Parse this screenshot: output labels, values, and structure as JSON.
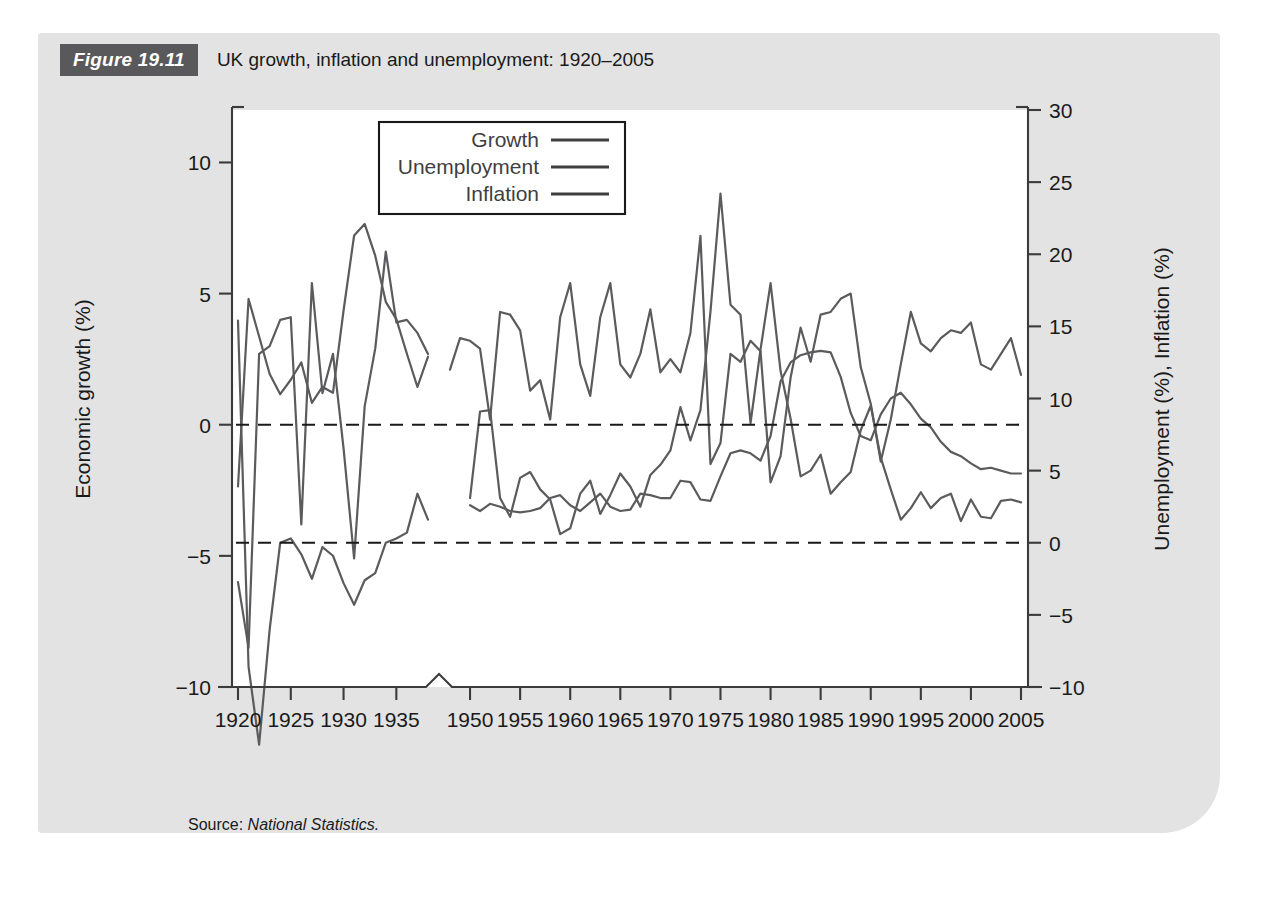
{
  "figure": {
    "tag": "Figure 19.11",
    "title": "UK growth, inflation and unemployment: 1920–2005",
    "source_label": "Source:",
    "source_value": "National Statistics."
  },
  "chart_data": {
    "type": "line",
    "title": "UK growth, inflation and unemployment: 1920–2005",
    "xlabel": "",
    "ylabel": "Economic growth (%)",
    "y2label": "Unemployment (%), Inflation (%)",
    "xlim": [
      1920,
      2005
    ],
    "ylim": [
      -10,
      12
    ],
    "y2lim": [
      -10,
      30
    ],
    "yticks": [
      -10,
      -5,
      0,
      5,
      10
    ],
    "yticklabels": [
      "−10",
      "−5",
      "0",
      "5",
      "10"
    ],
    "y2ticks": [
      -10,
      -5,
      0,
      5,
      10,
      15,
      20,
      25,
      30
    ],
    "y2ticklabels": [
      "−10",
      "−5",
      "0",
      "5",
      "10",
      "15",
      "20",
      "25",
      "30"
    ],
    "xticks": [
      1920,
      1925,
      1930,
      1935,
      1950,
      1955,
      1960,
      1965,
      1970,
      1975,
      1980,
      1985,
      1990,
      1995,
      2000,
      2005
    ],
    "xticklabels": [
      "1920",
      "1925",
      "1930",
      "1935",
      "1950",
      "1955",
      "1960",
      "1965",
      "1970",
      "1975",
      "1980",
      "1985",
      "1990",
      "1995",
      "2000",
      "2005"
    ],
    "axis_break": {
      "after": 1935,
      "before": 1950,
      "note": "zigzag break on x-axis between 1938 and 1948"
    },
    "grid": false,
    "reference_lines": [
      {
        "axis": "left",
        "value": 0,
        "style": "dashed"
      },
      {
        "axis": "right",
        "value": 0,
        "style": "dashed"
      }
    ],
    "legend": {
      "position": "top-center-inside",
      "entries": [
        "Growth",
        "Unemployment",
        "Inflation"
      ]
    },
    "series": [
      {
        "name": "Growth",
        "axis": "left",
        "unit": "%",
        "x": [
          1920,
          1921,
          1922,
          1923,
          1924,
          1925,
          1926,
          1927,
          1928,
          1929,
          1930,
          1931,
          1932,
          1933,
          1934,
          1935,
          1936,
          1937,
          1938
        ],
        "values": [
          -6.0,
          -8.5,
          2.7,
          3.0,
          4.0,
          4.1,
          -3.8,
          5.4,
          1.2,
          2.7,
          -0.9,
          -5.1,
          0.7,
          2.9,
          6.6,
          3.9,
          4.0,
          3.5,
          2.7
        ]
      },
      {
        "name": "Growth",
        "axis": "left",
        "unit": "%",
        "x": [
          1948,
          1949,
          1950,
          1951,
          1952,
          1953,
          1954,
          1955,
          1956,
          1957,
          1958,
          1959,
          1960,
          1961,
          1962,
          1963,
          1964,
          1965,
          1966,
          1967,
          1968,
          1969,
          1970,
          1971,
          1972,
          1973,
          1974,
          1975,
          1976,
          1977,
          1978,
          1979,
          1980,
          1981,
          1982,
          1983,
          1984,
          1985,
          1986,
          1987,
          1988,
          1989,
          1990,
          1991,
          1992,
          1993,
          1994,
          1995,
          1996,
          1997,
          1998,
          1999,
          2000,
          2001,
          2002,
          2003,
          2004,
          2005
        ],
        "values": [
          2.1,
          3.3,
          3.2,
          2.9,
          0.2,
          4.3,
          4.2,
          3.6,
          1.3,
          1.7,
          0.2,
          4.1,
          5.4,
          2.3,
          1.1,
          4.1,
          5.4,
          2.3,
          1.8,
          2.7,
          4.4,
          2.0,
          2.5,
          2.0,
          3.5,
          7.2,
          -1.5,
          -0.7,
          2.7,
          2.4,
          3.2,
          2.8,
          -2.2,
          -1.2,
          1.8,
          3.7,
          2.4,
          4.2,
          4.3,
          4.8,
          5.0,
          2.2,
          0.8,
          -1.4,
          0.2,
          2.3,
          4.3,
          3.1,
          2.8,
          3.3,
          3.6,
          3.5,
          3.9,
          2.3,
          2.1,
          2.7,
          3.3,
          1.9
        ]
      },
      {
        "name": "Unemployment",
        "axis": "right",
        "unit": "%",
        "x": [
          1920,
          1921,
          1922,
          1923,
          1924,
          1925,
          1926,
          1927,
          1928,
          1929,
          1930,
          1931,
          1932,
          1933,
          1934,
          1935,
          1936,
          1937,
          1938
        ],
        "values": [
          3.9,
          16.9,
          14.3,
          11.7,
          10.3,
          11.3,
          12.5,
          9.7,
          10.8,
          10.4,
          16.1,
          21.3,
          22.1,
          19.9,
          16.7,
          15.5,
          13.1,
          10.8,
          12.9
        ]
      },
      {
        "name": "Unemployment",
        "axis": "right",
        "unit": "%",
        "x": [
          1950,
          1951,
          1952,
          1953,
          1954,
          1955,
          1956,
          1957,
          1958,
          1959,
          1960,
          1961,
          1962,
          1963,
          1964,
          1965,
          1966,
          1967,
          1968,
          1969,
          1970,
          1971,
          1972,
          1973,
          1974,
          1975,
          1976,
          1977,
          1978,
          1979,
          1980,
          1981,
          1982,
          1983,
          1984,
          1985,
          1986,
          1987,
          1988,
          1989,
          1990,
          1991,
          1992,
          1993,
          1994,
          1995,
          1996,
          1997,
          1998,
          1999,
          2000,
          2001,
          2002,
          2003,
          2004,
          2005
        ],
        "values": [
          2.6,
          2.2,
          2.7,
          2.5,
          2.2,
          2.1,
          2.2,
          2.4,
          3.1,
          3.3,
          2.6,
          2.2,
          2.8,
          3.4,
          2.5,
          2.2,
          2.3,
          3.4,
          3.3,
          3.1,
          3.1,
          4.3,
          4.2,
          3.0,
          2.9,
          4.6,
          6.2,
          6.4,
          6.2,
          5.7,
          7.4,
          11.2,
          12.5,
          13.0,
          13.2,
          13.3,
          13.2,
          11.5,
          9.0,
          7.4,
          7.1,
          8.9,
          10.0,
          10.4,
          9.6,
          8.6,
          8.0,
          7.0,
          6.3,
          6.0,
          5.5,
          5.1,
          5.2,
          5.0,
          4.8,
          4.8
        ]
      },
      {
        "name": "Inflation",
        "axis": "right",
        "unit": "%",
        "x": [
          1920,
          1921,
          1922,
          1923,
          1924,
          1925,
          1926,
          1927,
          1928,
          1929,
          1930,
          1931,
          1932,
          1933,
          1934,
          1935,
          1936,
          1937,
          1938
        ],
        "values": [
          15.4,
          -8.6,
          -14.0,
          -6.0,
          0.0,
          0.3,
          -0.8,
          -2.5,
          -0.3,
          -0.9,
          -2.8,
          -4.3,
          -2.6,
          -2.1,
          0.0,
          0.3,
          0.7,
          3.4,
          1.6
        ]
      },
      {
        "name": "Inflation",
        "axis": "right",
        "unit": "%",
        "x": [
          1950,
          1951,
          1952,
          1953,
          1954,
          1955,
          1956,
          1957,
          1958,
          1959,
          1960,
          1961,
          1962,
          1963,
          1964,
          1965,
          1966,
          1967,
          1968,
          1969,
          1970,
          1971,
          1972,
          1973,
          1974,
          1975,
          1976,
          1977,
          1978,
          1979,
          1980,
          1981,
          1982,
          1983,
          1984,
          1985,
          1986,
          1987,
          1988,
          1989,
          1990,
          1991,
          1992,
          1993,
          1994,
          1995,
          1996,
          1997,
          1998,
          1999,
          2000,
          2001,
          2002,
          2003,
          2004,
          2005
        ],
        "values": [
          3.1,
          9.1,
          9.2,
          3.1,
          1.8,
          4.5,
          4.9,
          3.7,
          3.0,
          0.6,
          1.0,
          3.4,
          4.3,
          2.0,
          3.3,
          4.8,
          3.9,
          2.5,
          4.7,
          5.4,
          6.4,
          9.4,
          7.1,
          9.2,
          16.0,
          24.2,
          16.5,
          15.8,
          8.3,
          13.4,
          18.0,
          11.9,
          8.6,
          4.6,
          5.0,
          6.1,
          3.4,
          4.2,
          4.9,
          7.8,
          9.5,
          5.9,
          3.7,
          1.6,
          2.4,
          3.5,
          2.4,
          3.1,
          3.4,
          1.5,
          3.0,
          1.8,
          1.7,
          2.9,
          3.0,
          2.8
        ]
      }
    ]
  }
}
